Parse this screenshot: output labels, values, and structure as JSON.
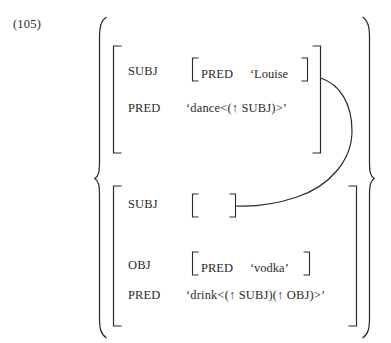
{
  "figure": {
    "example_number": "(105)",
    "type": "lfg-f-structure",
    "ink_color": "#2b2b2b",
    "background_color": "#ffffff"
  },
  "structures": [
    {
      "id": "f-structure-1",
      "rows": [
        {
          "attribute": "SUBJ",
          "value_kind": "matrix",
          "matrix": {
            "attribute": "PRED",
            "value": "‘Louise"
          }
        },
        {
          "attribute": "PRED",
          "value_kind": "atom",
          "value": "‘dance<(↑ SUBJ)>’"
        }
      ]
    },
    {
      "id": "f-structure-2",
      "rows": [
        {
          "attribute": "SUBJ",
          "value_kind": "empty-matrix",
          "matrix": {
            "attribute": "",
            "value": ""
          }
        },
        {
          "attribute": "OBJ",
          "value_kind": "matrix",
          "matrix": {
            "attribute": "PRED",
            "value": "‘vodka’"
          }
        },
        {
          "attribute": "PRED",
          "value_kind": "atom",
          "value": "‘drink<(↑ SUBJ)(↑ OBJ)>’"
        }
      ]
    }
  ],
  "connector": {
    "name": "structure-sharing-line",
    "from": "f-structure-1.SUBJ value matrix (right edge)",
    "to": "f-structure-2.SUBJ empty matrix (right bracket)"
  }
}
